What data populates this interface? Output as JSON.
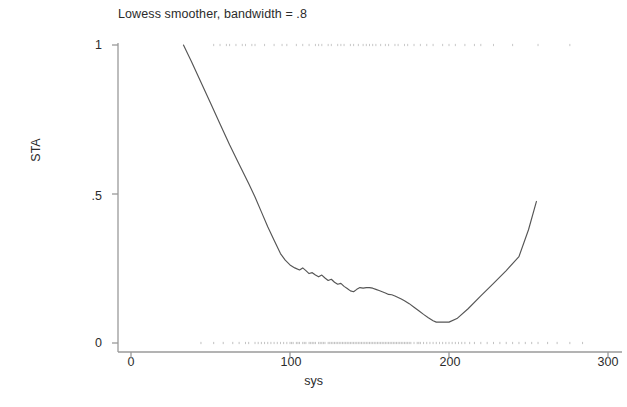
{
  "chart_data": {
    "type": "line",
    "title": "Lowess smoother, bandwidth = .8",
    "xlabel": "sys",
    "ylabel": "STA",
    "xlim": [
      0,
      300
    ],
    "ylim": [
      0,
      1
    ],
    "xticks": [
      0,
      100,
      200,
      300
    ],
    "xtick_labels": [
      "0",
      "100",
      "200",
      "300"
    ],
    "yticks": [
      0,
      0.5,
      1
    ],
    "ytick_labels": [
      "0",
      ".5",
      "1"
    ],
    "grid": false,
    "legend": null,
    "series": [
      {
        "name": "lowess smooth of STA on sys",
        "color": "#555555",
        "x": [
          33,
          38,
          44,
          50,
          56,
          62,
          68,
          74,
          78,
          82,
          86,
          90,
          94,
          97,
          100,
          103,
          106,
          108,
          110,
          112,
          114,
          116,
          118,
          120,
          122,
          124,
          126,
          128,
          130,
          132,
          134,
          136,
          138,
          140,
          142,
          144,
          146,
          148,
          150,
          152,
          154,
          156,
          158,
          160,
          162,
          164,
          166,
          168,
          170,
          172,
          175,
          178,
          181,
          184,
          187,
          190,
          192,
          196,
          200,
          205,
          212,
          220,
          228,
          236,
          244,
          250,
          255
        ],
        "y": [
          1.0,
          0.945,
          0.875,
          0.805,
          0.735,
          0.665,
          0.6,
          0.535,
          0.49,
          0.44,
          0.39,
          0.345,
          0.3,
          0.278,
          0.262,
          0.252,
          0.245,
          0.252,
          0.243,
          0.233,
          0.236,
          0.228,
          0.222,
          0.228,
          0.218,
          0.21,
          0.214,
          0.204,
          0.197,
          0.2,
          0.19,
          0.183,
          0.175,
          0.172,
          0.18,
          0.186,
          0.184,
          0.186,
          0.186,
          0.184,
          0.18,
          0.176,
          0.172,
          0.168,
          0.163,
          0.162,
          0.158,
          0.153,
          0.148,
          0.142,
          0.132,
          0.12,
          0.108,
          0.096,
          0.085,
          0.075,
          0.07,
          0.07,
          0.07,
          0.082,
          0.115,
          0.158,
          0.2,
          0.243,
          0.29,
          0.38,
          0.475
        ]
      }
    ],
    "rug_top": {
      "value": 1,
      "color": "#b8b8b8",
      "x": [
        52,
        56,
        60,
        62,
        66,
        70,
        72,
        76,
        78,
        84,
        90,
        95,
        98,
        104,
        108,
        112,
        116,
        118,
        120,
        124,
        126,
        130,
        132,
        134,
        138,
        140,
        143,
        146,
        148,
        150,
        152,
        154,
        157,
        160,
        162,
        166,
        168,
        172,
        174,
        178,
        182,
        186,
        190,
        196,
        200,
        204,
        210,
        216,
        220,
        228,
        240,
        256,
        276
      ]
    },
    "rug_bottom": {
      "value": 0,
      "color": "#b0b0b0",
      "x": [
        44,
        52,
        58,
        64,
        68,
        72,
        74,
        78,
        80,
        82,
        84,
        86,
        88,
        90,
        92,
        94,
        96,
        98,
        100,
        101,
        102,
        104,
        105,
        106,
        108,
        109,
        110,
        112,
        113,
        114,
        115,
        116,
        118,
        119,
        120,
        121,
        122,
        124,
        125,
        126,
        127,
        128,
        129,
        130,
        131,
        132,
        133,
        134,
        135,
        136,
        137,
        138,
        139,
        140,
        141,
        142,
        143,
        144,
        145,
        146,
        147,
        148,
        149,
        150,
        151,
        152,
        153,
        154,
        155,
        156,
        157,
        158,
        159,
        160,
        161,
        162,
        163,
        164,
        165,
        166,
        167,
        168,
        169,
        170,
        171,
        172,
        173,
        174,
        175,
        176,
        178,
        180,
        181,
        182,
        184,
        186,
        188,
        190,
        192,
        194,
        196,
        198,
        200,
        202,
        204,
        206,
        208,
        210,
        213,
        216,
        220,
        224,
        228,
        232,
        236,
        240,
        244,
        248,
        252,
        256,
        262,
        268,
        276,
        284
      ]
    },
    "axis_color": "#9a9a9a",
    "text_color": "#2b2b2b"
  }
}
